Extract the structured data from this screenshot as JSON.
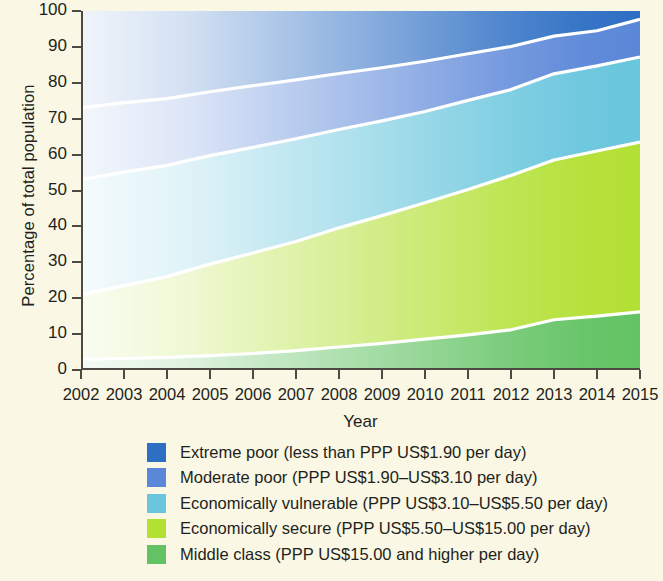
{
  "chart_data": {
    "type": "area",
    "title": "",
    "xlabel": "Year",
    "ylabel": "Percentage of total population",
    "grid": false,
    "legend_position": "bottom",
    "stacked": true,
    "x": [
      2002,
      2003,
      2004,
      2005,
      2006,
      2007,
      2008,
      2009,
      2010,
      2011,
      2012,
      2013,
      2014,
      2015
    ],
    "xtick_labels": [
      "2002",
      "2003",
      "2004",
      "2005",
      "2006",
      "2007",
      "2008",
      "2009",
      "2010",
      "2011",
      "2012",
      "2013",
      "2014",
      "2015"
    ],
    "ytick_labels": [
      "0",
      "10",
      "20",
      "30",
      "40",
      "50",
      "60",
      "70",
      "80",
      "90",
      "100"
    ],
    "ylim": [
      0,
      100
    ],
    "yticks": [
      0,
      10,
      20,
      30,
      40,
      50,
      60,
      70,
      80,
      90,
      100
    ],
    "series": [
      {
        "name": "Middle class (PPP US$15.00 and higher per day)",
        "color": "#63c364",
        "values": [
          3.0,
          3.2,
          3.5,
          4.0,
          4.6,
          5.4,
          6.4,
          7.4,
          8.6,
          9.8,
          11.2,
          14.0,
          15.0,
          16.2
        ]
      },
      {
        "name": "Economically secure (PPP US$5.50–US$15.00 per day)",
        "color": "#b3e034",
        "values": [
          18.0,
          20.3,
          22.5,
          25.5,
          28.0,
          30.4,
          33.2,
          35.6,
          38.0,
          40.5,
          43.0,
          44.5,
          46.0,
          47.3
        ]
      },
      {
        "name": "Economically vulnerable (PPP US$3.10–US$5.50 per day)",
        "color": "#69c6dd",
        "values": [
          32.0,
          31.6,
          31.0,
          30.2,
          29.4,
          28.6,
          27.4,
          26.4,
          25.4,
          24.8,
          23.9,
          24.0,
          23.7,
          23.7
        ]
      },
      {
        "name": "Moderate poor (PPP US$1.90–US$3.10 per day)",
        "color": "#5b87d8",
        "values": [
          20.0,
          19.4,
          18.6,
          17.8,
          17.2,
          16.4,
          15.6,
          14.8,
          14.0,
          13.0,
          12.0,
          10.5,
          9.8,
          10.5
        ]
      },
      {
        "name": "Extreme poor (less than PPP US$1.90 per day)",
        "color": "#2e6fc4",
        "values": [
          27.0,
          25.5,
          24.4,
          22.5,
          20.8,
          19.2,
          17.4,
          15.8,
          14.0,
          11.9,
          9.9,
          7.0,
          5.5,
          2.3
        ]
      }
    ],
    "cumulative_top_boundaries": {
      "middle_class": [
        3.0,
        3.2,
        3.5,
        4.0,
        4.6,
        5.4,
        6.4,
        7.4,
        8.6,
        9.8,
        11.2,
        14.0,
        15.0,
        16.2
      ],
      "economically_secure": [
        21.0,
        23.5,
        26.0,
        29.5,
        32.6,
        35.8,
        39.6,
        43.0,
        46.6,
        50.3,
        54.2,
        58.5,
        61.0,
        63.5
      ],
      "economically_vulnerable": [
        53.0,
        55.1,
        57.0,
        59.7,
        62.0,
        64.4,
        67.0,
        69.4,
        72.0,
        75.1,
        78.1,
        82.5,
        84.7,
        87.2
      ],
      "moderate_poor": [
        73.0,
        74.5,
        75.6,
        77.5,
        79.2,
        80.8,
        82.6,
        84.2,
        86.0,
        88.1,
        90.1,
        93.0,
        94.5,
        97.7
      ],
      "extreme_poor": [
        100,
        100,
        100,
        100,
        100,
        100,
        100,
        100,
        100,
        100,
        100,
        100,
        100,
        100
      ]
    }
  },
  "axes": {
    "y_title": "Percentage of total population",
    "x_title": "Year",
    "y_ticks": [
      "100",
      "90",
      "80",
      "70",
      "60",
      "50",
      "40",
      "30",
      "20",
      "10",
      "0"
    ],
    "x_ticks": [
      "2002",
      "2003",
      "2004",
      "2005",
      "2006",
      "2007",
      "2008",
      "2009",
      "2010",
      "2011",
      "2012",
      "2013",
      "2014",
      "2015"
    ]
  },
  "legend": {
    "items": [
      {
        "label": "Extreme poor (less than PPP US$1.90 per day)",
        "color": "#2e6fc4",
        "icon": "color-swatch"
      },
      {
        "label": "Moderate poor (PPP US$1.90–US$3.10 per day)",
        "color": "#5b87d8",
        "icon": "color-swatch"
      },
      {
        "label": "Economically vulnerable (PPP US$3.10–US$5.50 per day)",
        "color": "#69c6dd",
        "icon": "color-swatch"
      },
      {
        "label": "Economically secure (PPP US$5.50–US$15.00 per day)",
        "color": "#b3e034",
        "icon": "color-swatch"
      },
      {
        "label": "Middle class (PPP US$15.00 and higher per day)",
        "color": "#63c364",
        "icon": "color-swatch"
      }
    ]
  },
  "style": {
    "background": "#faf7e4",
    "axis_color": "#4c4a42",
    "separator_color": "#ffffff"
  }
}
